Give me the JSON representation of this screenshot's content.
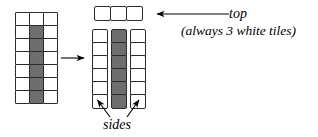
{
  "figure": {
    "colors": {
      "tile_white": "#ffffff",
      "tile_dark": "#6e6e6e",
      "outline": "#2b2b2b",
      "background": "#ffffff",
      "text": "#000000"
    }
  },
  "labels": {
    "top": "top",
    "top_note": "(always 3 white tiles)",
    "sides": "sides"
  },
  "assembled_grid": {
    "name": "assembled-tower",
    "columns": 3,
    "rows": 7,
    "origin": {
      "x": 15,
      "y": 12
    },
    "tile_size": {
      "width": 15,
      "height": 14
    },
    "cells": [
      [
        "white",
        "white",
        "white"
      ],
      [
        "white",
        "dark",
        "white"
      ],
      [
        "white",
        "dark",
        "white"
      ],
      [
        "white",
        "dark",
        "white"
      ],
      [
        "white",
        "dark",
        "white"
      ],
      [
        "white",
        "dark",
        "white"
      ],
      [
        "white",
        "dark",
        "white"
      ]
    ]
  },
  "exploded_view": {
    "name": "exploded-tower",
    "top_row": {
      "name": "top-row",
      "count": 3,
      "colors": [
        "white",
        "white",
        "white"
      ],
      "origin": {
        "x": 94,
        "y": 6
      },
      "gap": 2
    },
    "columns": [
      {
        "name": "left-side-column",
        "count": 6,
        "color": "white",
        "origin": {
          "x": 92,
          "y": 29
        },
        "gap": 1
      },
      {
        "name": "middle-column",
        "count": 6,
        "color": "dark",
        "origin": {
          "x": 111,
          "y": 29
        },
        "gap": 1
      },
      {
        "name": "right-side-column",
        "count": 6,
        "color": "white",
        "origin": {
          "x": 130,
          "y": 29
        },
        "gap": 1
      }
    ]
  },
  "arrows": [
    {
      "name": "transform-arrow",
      "direction": "right",
      "from": {
        "x": 61,
        "y": 58
      },
      "to": {
        "x": 86,
        "y": 58
      }
    },
    {
      "name": "top-callout-arrow",
      "direction": "left",
      "from": {
        "x": 229,
        "y": 14
      },
      "to": {
        "x": 155,
        "y": 14
      }
    },
    {
      "name": "sides-left-arrow",
      "direction": "up-left",
      "from": {
        "x": 110,
        "y": 117
      },
      "to": {
        "x": 96,
        "y": 99
      }
    },
    {
      "name": "sides-right-arrow",
      "direction": "up-right",
      "from": {
        "x": 127,
        "y": 117
      },
      "to": {
        "x": 140,
        "y": 99
      }
    }
  ]
}
